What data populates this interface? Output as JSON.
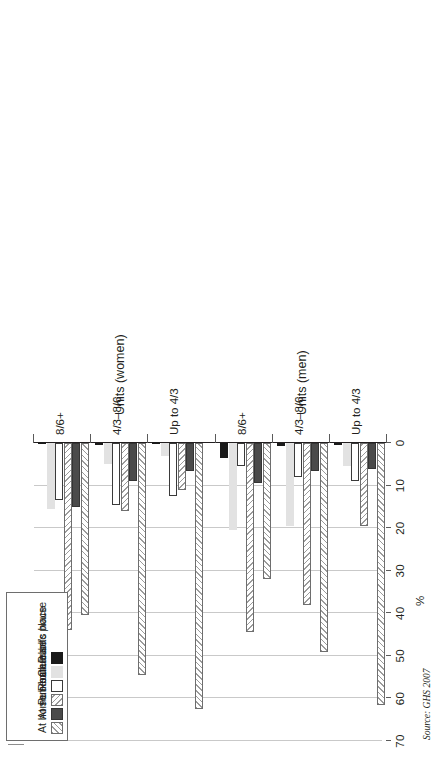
{
  "chart_data": {
    "type": "bar",
    "orientation": "horizontal",
    "title": "",
    "xlabel": "%",
    "ylabel": "Units (men) / Units (women)",
    "xlim": [
      0,
      70
    ],
    "xticks": [
      "0",
      "10",
      "20",
      "30",
      "40",
      "50",
      "60",
      "70"
    ],
    "grid": true,
    "legend_position": "top-left",
    "legend": [
      "At home",
      "At someone else's house",
      "Pub/bar",
      "Restaurant",
      "Club",
      "Public place"
    ],
    "groups": [
      {
        "panel": "Units (men)",
        "category": "Up to 4/3",
        "values": {
          "At home": 61.5,
          "At someone else's house": 6.0,
          "Pub/bar": 19.5,
          "Restaurant": 9.0,
          "Club": 5.5,
          "Public place": 0.4
        }
      },
      {
        "panel": "Units (men)",
        "category": "4/3–8/6",
        "values": {
          "At home": 49.0,
          "At someone else's house": 6.5,
          "Pub/bar": 38.0,
          "Restaurant": 8.0,
          "Club": 19.5,
          "Public place": 0.6
        }
      },
      {
        "panel": "Units (men)",
        "category": "8/6+",
        "values": {
          "At home": 32.0,
          "At someone else's house": 9.5,
          "Pub/bar": 44.5,
          "Restaurant": 5.5,
          "Club": 20.5,
          "Public place": 3.5
        }
      },
      {
        "panel": "Units (women)",
        "category": "Up to 4/3",
        "values": {
          "At home": 62.5,
          "At someone else's house": 6.5,
          "Pub/bar": 11.0,
          "Restaurant": 12.5,
          "Club": 3.0,
          "Public place": 0.3
        }
      },
      {
        "panel": "Units (women)",
        "category": "4/3–8/6",
        "values": {
          "At home": 54.5,
          "At someone else's house": 9.0,
          "Pub/bar": 16.0,
          "Restaurant": 14.5,
          "Club": 5.0,
          "Public place": 0.4
        }
      },
      {
        "panel": "Units (women)",
        "category": "8/6+",
        "values": {
          "At home": 40.5,
          "At someone else's house": 15.0,
          "Pub/bar": 44.0,
          "Restaurant": 13.5,
          "Club": 15.5,
          "Public place": 0.3
        }
      }
    ],
    "series": [
      {
        "name": "At home",
        "values": [
          61.5,
          49.0,
          32.0,
          62.5,
          54.5,
          40.5
        ]
      },
      {
        "name": "At someone else's house",
        "values": [
          6.0,
          6.5,
          9.5,
          6.5,
          9.0,
          15.0
        ]
      },
      {
        "name": "Pub/bar",
        "values": [
          19.5,
          38.0,
          44.5,
          11.0,
          16.0,
          44.0
        ]
      },
      {
        "name": "Restaurant",
        "values": [
          9.0,
          8.0,
          5.5,
          12.5,
          14.5,
          13.5
        ]
      },
      {
        "name": "Club",
        "values": [
          5.5,
          19.5,
          20.5,
          3.0,
          5.0,
          15.5
        ]
      },
      {
        "name": "Public place",
        "values": [
          0.4,
          0.6,
          3.5,
          0.3,
          0.4,
          0.3
        ]
      }
    ],
    "categories": [
      "Up to 4/3",
      "4/3–8/6",
      "8/6+",
      "Up to 4/3",
      "4/3–8/6",
      "8/6+"
    ]
  },
  "axis": {
    "value_title": "%",
    "ticks": [
      {
        "label": "70",
        "value": 70
      },
      {
        "label": "60",
        "value": 60
      },
      {
        "label": "50",
        "value": 50
      },
      {
        "label": "40",
        "value": 40
      },
      {
        "label": "30",
        "value": 30
      },
      {
        "label": "20",
        "value": 20
      },
      {
        "label": "10",
        "value": 10
      },
      {
        "label": "0",
        "value": 0
      }
    ],
    "panels": [
      {
        "title": "Units (men)",
        "categories": [
          "Up to 4/3",
          "4/3–8/6",
          "8/6+"
        ]
      },
      {
        "title": "Units (women)",
        "categories": [
          "Up to 4/3",
          "4/3–8/6",
          "8/6+"
        ]
      }
    ]
  },
  "legend": {
    "items": [
      {
        "label": "At home",
        "pattern": "diagonal-hatch-light",
        "swatch_class": "p-athome"
      },
      {
        "label": "At someone else's house",
        "pattern": "solid-dark-grey",
        "swatch_class": "p-someone"
      },
      {
        "label": "Pub/bar",
        "pattern": "diagonal-hatch-light",
        "swatch_class": "p-pub"
      },
      {
        "label": "Restaurant",
        "pattern": "white-outline",
        "swatch_class": "p-rest"
      },
      {
        "label": "Club",
        "pattern": "solid-light-grey",
        "swatch_class": "p-club"
      },
      {
        "label": "Public place",
        "pattern": "solid-black",
        "swatch_class": "p-public"
      }
    ]
  },
  "source": {
    "text": "Source: GHS 2007"
  },
  "colors": {
    "at_home": "#ffffff",
    "at_someone_elses_house": "#4a4a4a",
    "pub_bar": "#ffffff",
    "restaurant": "#ffffff",
    "club": "#e2e2e2",
    "public_place": "#1a1a1a",
    "gridline": "#c9c9c9",
    "axis": "#231f20"
  }
}
